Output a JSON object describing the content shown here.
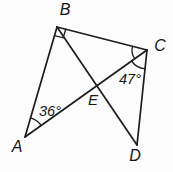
{
  "figure": {
    "background_color": "#fcfcfc",
    "line_color": "#1c1c1c",
    "text_color": "#161616",
    "vertex_labels": {
      "A": "A",
      "B": "B",
      "C": "C",
      "D": "D",
      "E": "E"
    },
    "angle_labels": {
      "at_A_between_AB_AC": "36°",
      "at_C_between_CA_CD": "47°"
    },
    "markers": {
      "right_angle_vertex": "B",
      "arc_at_A": "single arc spanning angle BAC",
      "arcs_at_C": "two arcs spanning angles BCA and ACD"
    }
  }
}
